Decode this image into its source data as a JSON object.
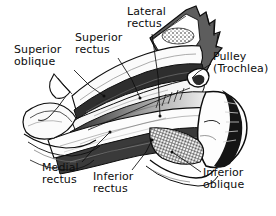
{
  "figure": {
    "background_color": "#ffffff",
    "ink_color": "#0d0d0d",
    "style": "black-and-white engraved line art with stipple and cross-hatch shading"
  },
  "labels": [
    {
      "id": "superior-oblique",
      "text": "Superior\noblique",
      "x": 14,
      "y": 44
    },
    {
      "id": "superior-rectus",
      "text": "Superior\nrectus",
      "x": 75,
      "y": 32
    },
    {
      "id": "lateral-rectus",
      "text": "Lateral\nrectus",
      "x": 127,
      "y": 6
    },
    {
      "id": "pulley-trochlea",
      "text": "Pulley\n(Trochlea)",
      "x": 213,
      "y": 51
    },
    {
      "id": "medial-rectus",
      "text": "Medial\nrectus",
      "x": 42,
      "y": 162
    },
    {
      "id": "inferior-rectus",
      "text": "Inferior\nrectus",
      "x": 93,
      "y": 171
    },
    {
      "id": "inferior-oblique",
      "text": "Inferior\noblique",
      "x": 203,
      "y": 167
    }
  ],
  "structures": [
    {
      "id": "orbital-bone",
      "name": "orbital bone with stippled marrow texture"
    },
    {
      "id": "eyeball-globe",
      "name": "eyeball globe with dark limbal crescent"
    },
    {
      "id": "muscle-bands",
      "name": "layered rectus muscle bands converging to orbital apex"
    },
    {
      "id": "trochlea-loop",
      "name": "trochlear pulley loop for superior oblique tendon"
    },
    {
      "id": "inferior-oblique-belly",
      "name": "cross-hatched inferior oblique muscle belly"
    }
  ]
}
